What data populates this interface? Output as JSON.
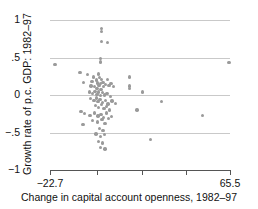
{
  "chart_data": {
    "type": "scatter",
    "title": "",
    "xlabel": "Change in capital account openness, 1982–97",
    "ylabel": "Growth rate of p.c. GDP: 1982–97",
    "xlim": [
      -22.7,
      65.5
    ],
    "ylim": [
      -1,
      1
    ],
    "grid": true,
    "legend": null,
    "xticks": [
      -22.7,
      0.5,
      22.2,
      43.9,
      65.5
    ],
    "xtick_labels": [
      "−22.7",
      "",
      "",
      "",
      "65.5"
    ],
    "yticks": [
      1,
      0.5,
      0,
      -0.5,
      -1
    ],
    "ytick_labels": [
      "1",
      ".5",
      "0",
      "−.5",
      "−1"
    ],
    "marker_color": "#9a9a9a",
    "gridline_color": "#c9c9c9",
    "axis_color": "#555555",
    "points": [
      [
        -20.3,
        0.41
      ],
      [
        2.4,
        0.89
      ],
      [
        2.4,
        0.85
      ],
      [
        2.4,
        0.71
      ],
      [
        5.4,
        0.7
      ],
      [
        2.1,
        0.49
      ],
      [
        2.1,
        0.44
      ],
      [
        -8.0,
        0.3
      ],
      [
        -4.2,
        0.27
      ],
      [
        -1.5,
        0.24
      ],
      [
        1.0,
        0.28
      ],
      [
        1.6,
        0.23
      ],
      [
        2.6,
        0.21
      ],
      [
        -6.3,
        0.17
      ],
      [
        -2.2,
        0.18
      ],
      [
        0.2,
        0.2
      ],
      [
        0.6,
        0.16
      ],
      [
        1.9,
        0.15
      ],
      [
        3.2,
        0.17
      ],
      [
        5.6,
        0.21
      ],
      [
        7.1,
        0.15
      ],
      [
        -2.6,
        0.12
      ],
      [
        -0.9,
        0.11
      ],
      [
        0.4,
        0.09
      ],
      [
        1.4,
        0.13
      ],
      [
        2.2,
        0.07
      ],
      [
        3.6,
        0.11
      ],
      [
        4.6,
        0.14
      ],
      [
        6.2,
        0.13
      ],
      [
        8.5,
        0.11
      ],
      [
        16.2,
        0.24
      ],
      [
        16.2,
        0.12
      ],
      [
        16.2,
        0.09
      ],
      [
        -3.4,
        0.04
      ],
      [
        -1.9,
        0.02
      ],
      [
        -0.6,
        0.05
      ],
      [
        0.3,
        0.01
      ],
      [
        1.1,
        0.04
      ],
      [
        2.0,
        -0.01
      ],
      [
        2.9,
        0.03
      ],
      [
        4.1,
        0.0
      ],
      [
        5.2,
        0.02
      ],
      [
        6.8,
        -0.02
      ],
      [
        22.6,
        0.04
      ],
      [
        -2.8,
        -0.05
      ],
      [
        -1.2,
        -0.07
      ],
      [
        0.0,
        -0.04
      ],
      [
        0.9,
        -0.09
      ],
      [
        1.8,
        -0.06
      ],
      [
        3.0,
        -0.1
      ],
      [
        4.4,
        -0.07
      ],
      [
        5.8,
        -0.12
      ],
      [
        7.6,
        -0.08
      ],
      [
        9.4,
        -0.11
      ],
      [
        32.0,
        -0.09
      ],
      [
        -0.3,
        -0.14
      ],
      [
        1.2,
        -0.17
      ],
      [
        2.5,
        -0.13
      ],
      [
        3.8,
        -0.18
      ],
      [
        5.1,
        -0.15
      ],
      [
        6.6,
        -0.2
      ],
      [
        -7.6,
        -0.22
      ],
      [
        -5.8,
        -0.25
      ],
      [
        -3.1,
        -0.27
      ],
      [
        -1.0,
        -0.24
      ],
      [
        0.8,
        -0.28
      ],
      [
        2.3,
        -0.26
      ],
      [
        3.5,
        -0.3
      ],
      [
        4.9,
        -0.24
      ],
      [
        6.0,
        -0.31
      ],
      [
        7.4,
        -0.29
      ],
      [
        20.0,
        -0.2
      ],
      [
        52.0,
        -0.27
      ],
      [
        -6.6,
        -0.39
      ],
      [
        -2.0,
        -0.34
      ],
      [
        0.5,
        -0.36
      ],
      [
        2.8,
        -0.33
      ],
      [
        4.2,
        -0.38
      ],
      [
        1.5,
        -0.45
      ],
      [
        3.3,
        -0.47
      ],
      [
        -0.2,
        -0.52
      ],
      [
        2.0,
        -0.55
      ],
      [
        4.0,
        -0.53
      ],
      [
        1.0,
        -0.62
      ],
      [
        3.1,
        -0.64
      ],
      [
        2.0,
        -0.7
      ],
      [
        4.3,
        -0.72
      ],
      [
        26.5,
        -0.59
      ],
      [
        65.0,
        0.43
      ]
    ]
  }
}
